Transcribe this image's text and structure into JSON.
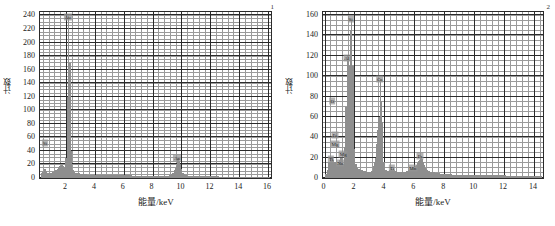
{
  "figure": {
    "panels": [
      {
        "id": "panel-1",
        "corner_tag": "1",
        "xlabel": "能量/keV",
        "ylabel": "计数",
        "xticks": [
          "2",
          "4",
          "6",
          "8",
          "10",
          "12",
          "14",
          "16"
        ],
        "yticks": [
          "0",
          "20",
          "40",
          "60",
          "80",
          "100",
          "120",
          "140",
          "160",
          "180",
          "200",
          "220",
          "240"
        ]
      },
      {
        "id": "panel-2",
        "corner_tag": "2",
        "xlabel": "能量/keV",
        "ylabel": "计数",
        "xticks": [
          "0",
          "2",
          "4",
          "6",
          "8",
          "10",
          "12",
          "14"
        ],
        "yticks": [
          "0",
          "20",
          "40",
          "60",
          "80",
          "100",
          "120",
          "140",
          "160"
        ]
      }
    ]
  },
  "chart_data": [
    {
      "type": "line",
      "title": "",
      "subtitle": "1",
      "xlabel": "能量/keV",
      "ylabel": "计数",
      "xlim": [
        0.2,
        16.2
      ],
      "ylim": [
        0,
        245
      ],
      "xticks": [
        2,
        4,
        6,
        8,
        10,
        12,
        14,
        16
      ],
      "yticks": [
        0,
        20,
        40,
        60,
        80,
        100,
        120,
        140,
        160,
        180,
        200,
        220,
        240
      ],
      "grid": "major-and-minor",
      "legend": "none",
      "annotations": [
        {
          "label": "Au",
          "x": 2.12,
          "y": 238
        },
        {
          "label": "Si",
          "x": 0.45,
          "y": 52
        },
        {
          "label": "Au",
          "x": 9.71,
          "y": 30
        }
      ],
      "series": [
        {
          "name": "EDS counts",
          "color": "#8e8e8e",
          "x": [
            0.25,
            0.35,
            0.45,
            0.55,
            0.65,
            0.75,
            0.85,
            0.95,
            1.05,
            1.15,
            1.25,
            1.35,
            1.45,
            1.55,
            1.65,
            1.75,
            1.85,
            1.95,
            2.05,
            2.12,
            2.2,
            2.3,
            2.4,
            2.5,
            2.6,
            2.8,
            3.0,
            3.2,
            3.4,
            3.6,
            3.8,
            4.0,
            4.4,
            4.8,
            5.2,
            5.6,
            6.0,
            6.4,
            6.8,
            7.2,
            7.6,
            8.0,
            8.4,
            8.8,
            9.2,
            9.4,
            9.6,
            9.71,
            9.85,
            10.0,
            10.2,
            10.6,
            11.0,
            11.4,
            11.8,
            12.2,
            12.6,
            13.0,
            13.4,
            13.8,
            14.2,
            14.6,
            15.0,
            15.4,
            15.8,
            16.1
          ],
          "y": [
            8,
            9,
            14,
            10,
            8,
            7,
            7,
            8,
            9,
            10,
            12,
            14,
            16,
            18,
            19,
            18,
            16,
            30,
            120,
            240,
            170,
            40,
            12,
            9,
            8,
            7,
            6,
            6,
            5,
            5,
            5,
            5,
            4,
            4,
            4,
            4,
            4,
            4,
            3,
            3,
            3,
            3,
            3,
            3,
            4,
            8,
            18,
            30,
            20,
            8,
            4,
            3,
            3,
            3,
            3,
            3,
            2,
            2,
            2,
            2,
            2,
            2,
            2,
            2,
            2,
            2
          ]
        }
      ]
    },
    {
      "type": "line",
      "title": "",
      "subtitle": "2",
      "xlabel": "能量/keV",
      "ylabel": "计数",
      "xlim": [
        -0.1,
        14.6
      ],
      "ylim": [
        0,
        163
      ],
      "xticks": [
        0,
        2,
        4,
        6,
        8,
        10,
        12,
        14
      ],
      "yticks": [
        0,
        20,
        40,
        60,
        80,
        100,
        120,
        140,
        160
      ],
      "grid": "major-and-minor",
      "legend": "none",
      "annotations": [
        {
          "label": "Si",
          "x": 1.74,
          "y": 156
        },
        {
          "label": "Al",
          "x": 1.49,
          "y": 118
        },
        {
          "label": "Ca",
          "x": 3.69,
          "y": 97
        },
        {
          "label": "O",
          "x": 0.52,
          "y": 76
        },
        {
          "label": "Fe",
          "x": 0.7,
          "y": 42
        },
        {
          "label": "Mg",
          "x": 0.7,
          "y": 33
        },
        {
          "label": "Mg",
          "x": 1.25,
          "y": 24
        },
        {
          "label": "Ti",
          "x": 0.45,
          "y": 19
        },
        {
          "label": "Na",
          "x": 1.04,
          "y": 15
        },
        {
          "label": "Fe",
          "x": 6.4,
          "y": 22
        },
        {
          "label": "Mn",
          "x": 5.9,
          "y": 10
        },
        {
          "label": "Ti",
          "x": 4.51,
          "y": 10
        }
      ],
      "series": [
        {
          "name": "EDS counts",
          "color": "#8e8e8e",
          "x": [
            0.05,
            0.15,
            0.25,
            0.35,
            0.45,
            0.52,
            0.6,
            0.7,
            0.8,
            0.9,
            1.0,
            1.04,
            1.1,
            1.2,
            1.3,
            1.4,
            1.49,
            1.6,
            1.7,
            1.74,
            1.8,
            1.9,
            2.0,
            2.1,
            2.2,
            2.4,
            2.6,
            2.8,
            3.0,
            3.2,
            3.4,
            3.6,
            3.69,
            3.8,
            3.9,
            4.0,
            4.2,
            4.4,
            4.51,
            4.7,
            4.9,
            5.1,
            5.3,
            5.5,
            5.7,
            5.9,
            6.1,
            6.3,
            6.4,
            6.55,
            6.7,
            6.9,
            7.1,
            7.4,
            7.8,
            8.2,
            8.6,
            9.0,
            9.4,
            9.8,
            10.2,
            10.6,
            11.0,
            11.4,
            11.8,
            12.2,
            12.6,
            13.0,
            13.4,
            13.8,
            14.2,
            14.5
          ],
          "y": [
            4,
            8,
            16,
            20,
            20,
            18,
            16,
            14,
            14,
            14,
            18,
            20,
            17,
            14,
            30,
            70,
            120,
            110,
            145,
            155,
            110,
            28,
            14,
            10,
            9,
            8,
            7,
            6,
            6,
            7,
            20,
            60,
            97,
            55,
            16,
            8,
            7,
            8,
            9,
            7,
            6,
            6,
            6,
            7,
            9,
            10,
            13,
            18,
            22,
            16,
            10,
            7,
            6,
            5,
            4,
            4,
            3,
            3,
            3,
            3,
            3,
            3,
            3,
            3,
            3,
            2,
            2,
            2,
            2,
            2,
            2,
            2
          ]
        }
      ]
    }
  ]
}
